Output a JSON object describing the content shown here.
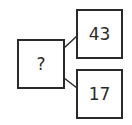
{
  "diagram": {
    "root": {
      "label": "?"
    },
    "children": [
      {
        "label": "43"
      },
      {
        "label": "17"
      }
    ],
    "colors": {
      "stroke": "#2a2a2a",
      "background": "#ffffff"
    }
  }
}
